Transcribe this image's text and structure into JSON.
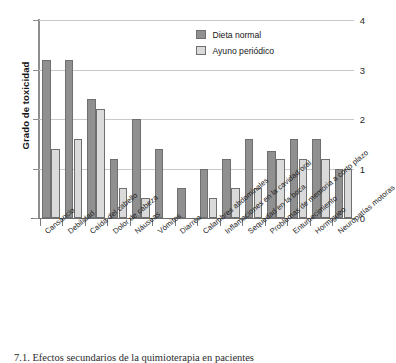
{
  "figure": {
    "caption": "7.1. Efectos secundarios de la quimioterapia en pacientes"
  },
  "legend": {
    "position": "top-right",
    "entries": [
      {
        "label": "Dieta normal",
        "swatch": "normal",
        "color": "#909090"
      },
      {
        "label": "Ayuno periódico",
        "swatch": "fasting",
        "color": "#dadada"
      }
    ]
  },
  "axes": {
    "y_title": "Grado de toxicidad",
    "y_ticks": [
      "0",
      "1",
      "2",
      "3",
      "4"
    ]
  },
  "chart_data": {
    "type": "bar",
    "title": "",
    "xlabel": "",
    "ylabel": "Grado de toxicidad",
    "ylim": [
      0,
      4
    ],
    "yticks": [
      0,
      1,
      2,
      3,
      4
    ],
    "grid": true,
    "legend_position": "top-right",
    "categories": [
      "Cansancio",
      "Debilidad",
      "Caída del cabello",
      "Dolor de cabeza",
      "Náuseas",
      "Vómitos",
      "Diarrea",
      "Calambres abdominales",
      "Inflamaciones en la cavidad oral",
      "Sequedad en la boca",
      "Problemas de memoria a corto plazo",
      "Entumecimiento",
      "Hormigueo",
      "Neuropatías motoras"
    ],
    "series": [
      {
        "name": "Dieta normal",
        "color": "#909090",
        "values": [
          3.2,
          3.2,
          2.4,
          1.2,
          2.0,
          1.4,
          0.6,
          1.0,
          1.2,
          1.6,
          1.35,
          1.6,
          1.6,
          1.0
        ]
      },
      {
        "name": "Ayuno periódico",
        "color": "#dadada",
        "values": [
          1.4,
          1.6,
          2.2,
          0.6,
          0.4,
          0,
          0,
          0.4,
          0.6,
          0.6,
          1.2,
          1.2,
          1.2,
          1.0
        ]
      }
    ]
  }
}
